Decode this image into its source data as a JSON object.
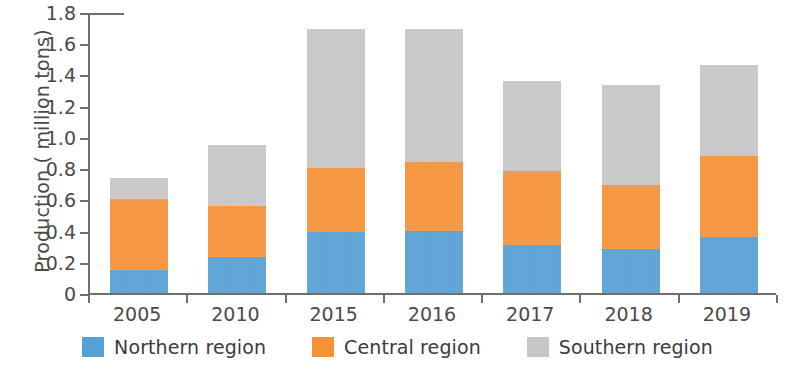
{
  "chart_data": {
    "type": "bar",
    "subtype": "stacked-bar",
    "title": "",
    "xlabel": "",
    "ylabel": "Production ( million tons)",
    "categories": [
      "2005",
      "2010",
      "2015",
      "2016",
      "2017",
      "2018",
      "2019"
    ],
    "series": [
      {
        "name": "Northern region",
        "color": "#57a0d3",
        "values": [
          0.15,
          0.23,
          0.39,
          0.4,
          0.31,
          0.28,
          0.36
        ]
      },
      {
        "name": "Central region",
        "color": "#f79239",
        "values": [
          0.45,
          0.33,
          0.41,
          0.44,
          0.47,
          0.41,
          0.52
        ]
      },
      {
        "name": "Southern region",
        "color": "#c6c6c6",
        "values": [
          0.14,
          0.39,
          0.89,
          0.85,
          0.58,
          0.64,
          0.58
        ]
      }
    ],
    "totals": [
      0.74,
      0.95,
      1.69,
      1.69,
      1.36,
      1.33,
      1.46
    ],
    "ylim": [
      0,
      1.8
    ],
    "ytick_values": [
      0,
      0.2,
      0.4,
      0.6,
      0.8,
      1.0,
      1.2,
      1.4,
      1.6,
      1.8
    ],
    "ytick_labels": [
      "0",
      "0.2",
      "0.4",
      "0.6",
      "0.8",
      "1.0",
      "1.2",
      "1.4",
      "1.6",
      "1.8"
    ],
    "grid": false,
    "legend_position": "bottom",
    "legend_entries": [
      "Northern region",
      "Central region",
      "Southern region"
    ]
  },
  "axis": {
    "line_color": "#6e6e6e"
  }
}
